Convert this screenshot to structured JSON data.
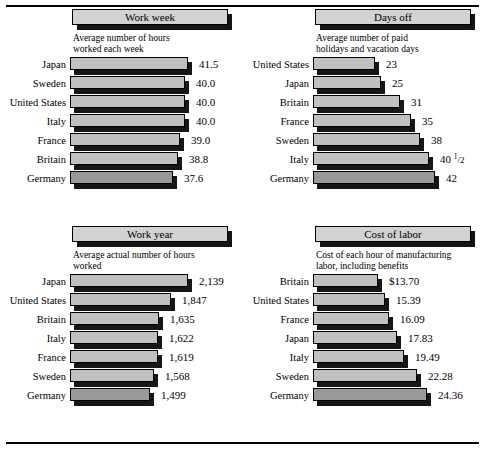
{
  "document": {
    "clipped_header": "",
    "rules": {
      "color": "#000000"
    }
  },
  "colors": {
    "bar_fill": "#c0c0c0",
    "bar_fill_last": "#999999",
    "bar_shadow": "#161616",
    "banner_fill": "#d2d2d2",
    "banner_shadow": "#141414",
    "text": "#000000",
    "background": "#ffffff"
  },
  "chart_data": [
    {
      "id": "work-week",
      "type": "bar",
      "orientation": "horizontal",
      "title": "Work week",
      "subtitle": "Average number of hours\nworked each week",
      "xlabel": "",
      "ylabel": "",
      "grid": false,
      "legend": "none",
      "axis_note": "truncated scale — bars do not start at zero",
      "categories": [
        "Japan",
        "Sweden",
        "United States",
        "Italy",
        "France",
        "Britain",
        "Germany"
      ],
      "values": [
        41.5,
        40.0,
        40.0,
        40.0,
        39.0,
        38.8,
        37.6
      ],
      "value_labels": [
        "41.5",
        "40.0",
        "40.0",
        "40.0",
        "39.0",
        "38.8",
        "37.6"
      ],
      "bar_widths_px": [
        118,
        115,
        115,
        115,
        110,
        108,
        103
      ]
    },
    {
      "id": "days-off",
      "type": "bar",
      "orientation": "horizontal",
      "title": "Days off",
      "subtitle": "Average number of paid\nholidays and vacation days",
      "xlabel": "",
      "ylabel": "",
      "grid": false,
      "legend": "none",
      "axis_note": "truncated scale — bars do not start at zero",
      "categories": [
        "United States",
        "Japan",
        "Britain",
        "France",
        "Sweden",
        "Italy",
        "Germany"
      ],
      "values": [
        23,
        25,
        31,
        35,
        38,
        40.5,
        42
      ],
      "value_labels": [
        "23",
        "25",
        "31",
        "35",
        "38",
        "40 ½",
        "42"
      ],
      "bar_widths_px": [
        62,
        68,
        87,
        98,
        107,
        116,
        122
      ]
    },
    {
      "id": "work-year",
      "type": "bar",
      "orientation": "horizontal",
      "title": "Work year",
      "subtitle": "Average actual number of hours\nworked",
      "xlabel": "",
      "ylabel": "",
      "grid": false,
      "legend": "none",
      "axis_note": "truncated scale — bars do not start at zero",
      "categories": [
        "Japan",
        "United States",
        "Britain",
        "Italy",
        "France",
        "Sweden",
        "Germany"
      ],
      "values": [
        2139,
        1847,
        1635,
        1622,
        1619,
        1568,
        1499
      ],
      "value_labels": [
        "2,139",
        "1,847",
        "1,635",
        "1,622",
        "1,619",
        "1,568",
        "1,499"
      ],
      "bar_widths_px": [
        118,
        101,
        89,
        88,
        88,
        84,
        80
      ]
    },
    {
      "id": "cost-of-labor",
      "type": "bar",
      "orientation": "horizontal",
      "title": "Cost of labor",
      "subtitle": "Cost of each hour of manufacturing\nlabor, including benefits",
      "xlabel": "",
      "ylabel": "",
      "grid": false,
      "legend": "none",
      "axis_note": "truncated scale — bars do not start at zero",
      "categories": [
        "Britain",
        "United States",
        "France",
        "Japan",
        "Italy",
        "Sweden",
        "Germany"
      ],
      "values": [
        13.7,
        15.39,
        16.09,
        17.83,
        19.49,
        22.28,
        24.36
      ],
      "value_labels": [
        "$13.70",
        "15.39",
        "16.09",
        "17.83",
        "19.49",
        "22.28",
        "24.36"
      ],
      "bar_widths_px": [
        65,
        72,
        76,
        84,
        91,
        104,
        114
      ]
    }
  ]
}
